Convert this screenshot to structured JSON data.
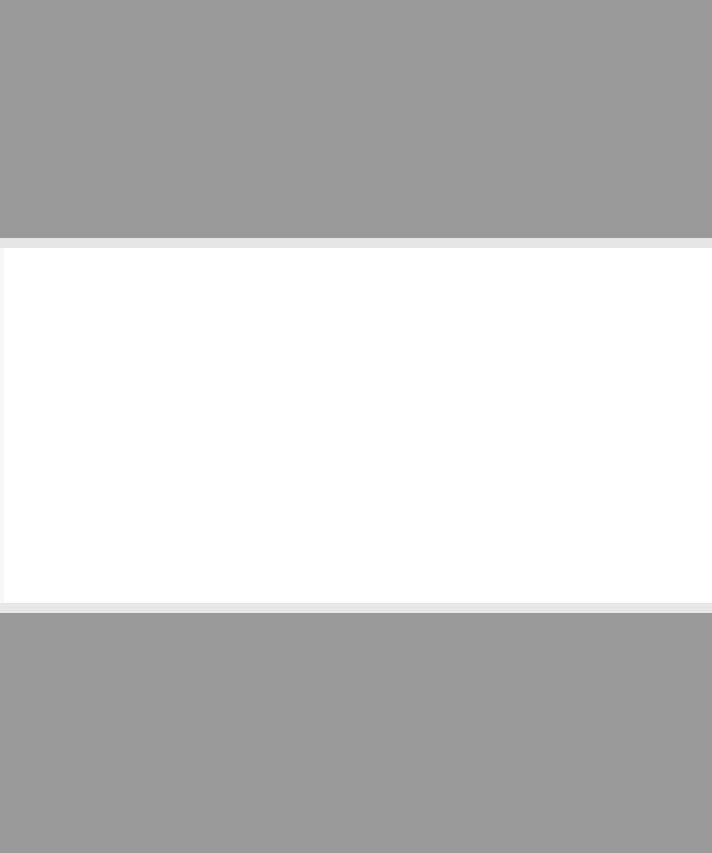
{
  "screen": {
    "state": "blank",
    "colors": {
      "backdrop": "#9a9a9a",
      "panel_border": "#e6e6e6",
      "panel": "#ffffff"
    }
  }
}
